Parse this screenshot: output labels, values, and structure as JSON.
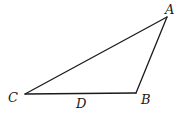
{
  "figure": {
    "type": "triangle",
    "vertices": {
      "A": {
        "label": "A",
        "x": 167,
        "y": 17
      },
      "B": {
        "label": "B",
        "x": 136,
        "y": 93
      },
      "C": {
        "label": "C",
        "x": 25,
        "y": 94
      }
    },
    "edges": [
      {
        "from": "C",
        "to": "A"
      },
      {
        "from": "A",
        "to": "B"
      },
      {
        "from": "B",
        "to": "C"
      }
    ],
    "points_on_edges": [
      {
        "label": "D",
        "edge": "CB"
      }
    ],
    "labels": {
      "A": "A",
      "B": "B",
      "C": "C",
      "D": "D"
    },
    "colors": {
      "stroke": "#1a1a1a",
      "background": "#ffffff"
    }
  }
}
